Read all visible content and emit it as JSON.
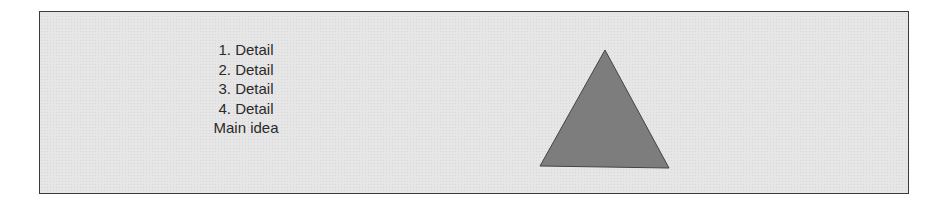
{
  "diagram": {
    "details": [
      "1. Detail",
      "2. Detail",
      "3. Detail",
      "4. Detail"
    ],
    "main_idea": "Main idea",
    "shape": "triangle",
    "colors": {
      "panel_bg": "#e6e6e6",
      "panel_border": "#3a3a3a",
      "triangle_fill": "#7d7d7d",
      "text": "#2a2a2a"
    }
  }
}
